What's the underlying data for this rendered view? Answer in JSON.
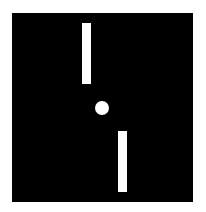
{
  "game": {
    "type": "pong",
    "colors": {
      "background": "#ffffff",
      "field": "#000000",
      "foreground": "#ffffff"
    },
    "field": {
      "x": 12,
      "y": 13,
      "width": 181,
      "height": 189
    },
    "paddles": [
      {
        "id": "top-paddle",
        "x": 82,
        "y": 23,
        "width": 9,
        "height": 61
      },
      {
        "id": "bottom-paddle",
        "x": 118,
        "y": 131,
        "width": 9,
        "height": 61
      }
    ],
    "ball": {
      "cx": 102,
      "cy": 108,
      "radius": 7
    }
  }
}
